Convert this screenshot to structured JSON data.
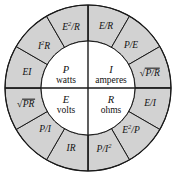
{
  "diagram": {
    "colors": {
      "ring_fill": "#d2d2d2",
      "inner_fill": "#ffffff",
      "stroke": "#1a1a1a",
      "background": "#ffffff"
    },
    "geometry": {
      "center_x": 88,
      "center_y": 88,
      "outer_radius": 83,
      "inner_radius": 47,
      "sector_count": 12,
      "sector_degrees": 30
    },
    "inner_quadrants": [
      {
        "symbol": "P",
        "unit": "watts",
        "position": "top-left"
      },
      {
        "symbol": "I",
        "unit": "amperes",
        "position": "top-right"
      },
      {
        "symbol": "E",
        "unit": "volts",
        "position": "bottom-left"
      },
      {
        "symbol": "R",
        "unit": "ohms",
        "position": "bottom-right"
      }
    ],
    "ring_sectors": [
      {
        "id": "p-e2-over-r",
        "quadrant": "top-left",
        "kind": "fraction_sup",
        "num_base": "E",
        "num_sup": "2",
        "den": "R",
        "display": "E2/R"
      },
      {
        "id": "p-i2-r",
        "quadrant": "top-left",
        "kind": "product_sup",
        "base": "I",
        "sup": "2",
        "tail": "R",
        "display": "I2R"
      },
      {
        "id": "p-ei",
        "quadrant": "top-left",
        "kind": "plain",
        "text": "EI",
        "display": "EI"
      },
      {
        "id": "i-e-over-r",
        "quadrant": "top-right",
        "kind": "plain",
        "text": "E/R",
        "display": "E/R"
      },
      {
        "id": "i-p-over-e",
        "quadrant": "top-right",
        "kind": "plain",
        "text": "P/E",
        "display": "P/E"
      },
      {
        "id": "i-sqrt-p-r",
        "quadrant": "top-right",
        "kind": "radical",
        "radicand": "P/R",
        "display": "sqrt(P/R)"
      },
      {
        "id": "e-sqrt-pr",
        "quadrant": "bottom-left",
        "kind": "radical",
        "radicand": "PR",
        "display": "sqrt(PR)"
      },
      {
        "id": "e-p-over-i",
        "quadrant": "bottom-left",
        "kind": "plain",
        "text": "P/I",
        "display": "P/I"
      },
      {
        "id": "e-ir",
        "quadrant": "bottom-left",
        "kind": "plain",
        "text": "IR",
        "display": "IR"
      },
      {
        "id": "r-p-over-i2",
        "quadrant": "bottom-right",
        "kind": "fraction_den_sup",
        "num": "P/I",
        "den_sup": "2",
        "display": "P/I2"
      },
      {
        "id": "r-e2-over-p",
        "quadrant": "bottom-right",
        "kind": "fraction_sup",
        "num_base": "E",
        "num_sup": "2",
        "den": "P",
        "display": "E2/P"
      },
      {
        "id": "r-e-over-i",
        "quadrant": "bottom-right",
        "kind": "plain",
        "text": "E/I",
        "display": "E/I"
      }
    ],
    "radical_sign": "√"
  }
}
